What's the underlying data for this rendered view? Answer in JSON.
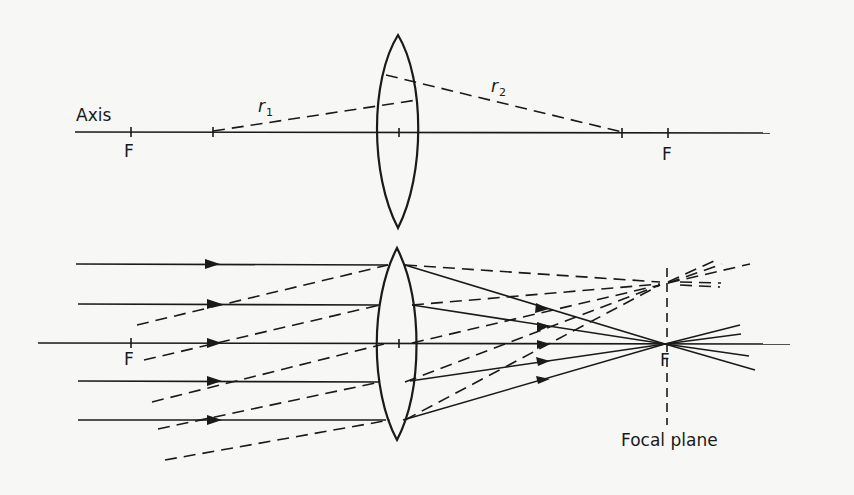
{
  "diagram": {
    "colors": {
      "ink": "#1a1a1a",
      "paper": "#f7f7f5"
    },
    "top_panel": {
      "axis_label": "Axis",
      "focus_left_label": "F",
      "focus_right_label": "F",
      "radius1_symbol": "r",
      "radius1_subscript": "1",
      "radius2_symbol": "r",
      "radius2_subscript": "2"
    },
    "bottom_panel": {
      "focus_left_label": "F",
      "focus_right_label": "F",
      "focal_plane_label": "Focal plane",
      "parallel_ray_count": 5,
      "oblique_ray_count": 5
    }
  }
}
